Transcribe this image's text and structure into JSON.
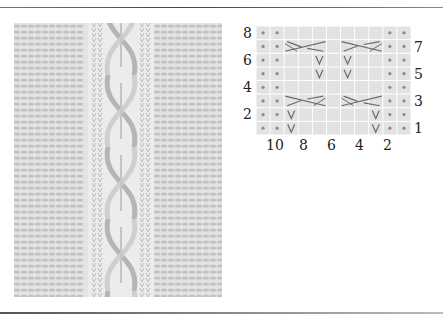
{
  "figure": {
    "type": "knitting-chart",
    "photo": {
      "subject": "cable knit swatch",
      "alt": "Knitted swatch with cable panel"
    },
    "chart": {
      "columns": 11,
      "rows": 8,
      "row_labels_left": [
        "8",
        "6",
        "4",
        "2"
      ],
      "row_labels_right": [
        "7",
        "5",
        "3",
        "1"
      ],
      "column_labels": [
        "10",
        "8",
        "6",
        "4",
        "2"
      ],
      "colors": {
        "cell": "#e2e2e2",
        "gridline": "#ffffff",
        "dot": "#8a8a8a",
        "symbol": "#6a6a6a"
      },
      "rows_data": [
        {
          "row": 8,
          "cells": [
            "purl",
            "purl",
            "k",
            "k",
            "k",
            "k",
            "k",
            "k",
            "k",
            "purl",
            "purl"
          ]
        },
        {
          "row": 7,
          "cells": [
            "purl",
            "purl",
            "cross-left",
            "cross-left",
            "cross-left",
            "k",
            "cross-right",
            "cross-right",
            "cross-right",
            "purl",
            "purl"
          ]
        },
        {
          "row": 6,
          "cells": [
            "purl",
            "purl",
            "k",
            "k",
            "slip",
            "k",
            "slip",
            "k",
            "k",
            "purl",
            "purl"
          ]
        },
        {
          "row": 5,
          "cells": [
            "purl",
            "purl",
            "k",
            "k",
            "slip",
            "k",
            "slip",
            "k",
            "k",
            "purl",
            "purl"
          ]
        },
        {
          "row": 4,
          "cells": [
            "purl",
            "purl",
            "k",
            "k",
            "k",
            "k",
            "k",
            "k",
            "k",
            "purl",
            "purl"
          ]
        },
        {
          "row": 3,
          "cells": [
            "purl",
            "purl",
            "cross-right",
            "cross-right",
            "cross-right",
            "k",
            "cross-left",
            "cross-left",
            "cross-left",
            "purl",
            "purl"
          ]
        },
        {
          "row": 2,
          "cells": [
            "purl",
            "purl",
            "slip",
            "k",
            "k",
            "k",
            "k",
            "k",
            "slip",
            "purl",
            "purl"
          ]
        },
        {
          "row": 1,
          "cells": [
            "purl",
            "purl",
            "slip",
            "k",
            "k",
            "k",
            "k",
            "k",
            "slip",
            "purl",
            "purl"
          ]
        }
      ]
    }
  }
}
